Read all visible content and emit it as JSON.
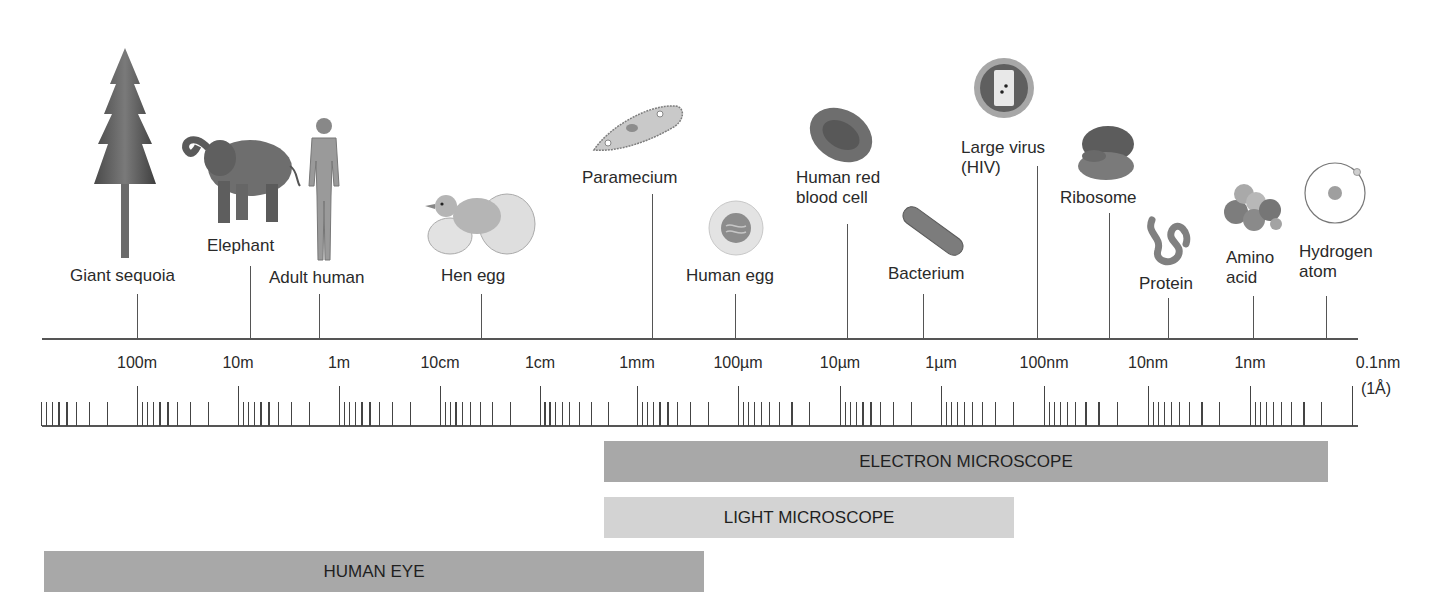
{
  "diagram": {
    "type": "log-scale size comparison",
    "objects": [
      {
        "id": "giant-sequoia",
        "label": "Giant sequoia",
        "size": "~100m"
      },
      {
        "id": "elephant",
        "label": "Elephant",
        "size": "~10m"
      },
      {
        "id": "adult-human",
        "label": "Adult human",
        "size": "~1.7m"
      },
      {
        "id": "hen-egg",
        "label": "Hen egg",
        "size": "~5cm"
      },
      {
        "id": "paramecium",
        "label": "Paramecium",
        "size": "~0.2mm"
      },
      {
        "id": "human-egg",
        "label": "Human egg",
        "size": "~100µm"
      },
      {
        "id": "red-blood-cell",
        "label_line1": "Human red",
        "label_line2": "blood cell",
        "size": "~7µm"
      },
      {
        "id": "bacterium",
        "label": "Bacterium",
        "size": "~1µm"
      },
      {
        "id": "large-virus",
        "label_line1": "Large virus",
        "label_line2": "(HIV)",
        "size": "~100nm"
      },
      {
        "id": "ribosome",
        "label": "Ribosome",
        "size": "~25nm"
      },
      {
        "id": "protein",
        "label": "Protein",
        "size": "~5nm"
      },
      {
        "id": "amino-acid",
        "label_line1": "Amino",
        "label_line2": "acid",
        "size": "~1nm"
      },
      {
        "id": "hydrogen-atom",
        "label_line1": "Hydrogen",
        "label_line2": "atom",
        "size": "~0.1nm"
      }
    ],
    "scale_labels": [
      "100m",
      "10m",
      "1m",
      "10cm",
      "1cm",
      "1mm",
      "100µm",
      "10µm",
      "1µm",
      "100nm",
      "10nm",
      "1nm",
      "0.1nm"
    ],
    "scale_note": "(1Å)",
    "ranges": [
      {
        "label": "ELECTRON MICROSCOPE",
        "from": "1mm",
        "to": "~0.2nm",
        "color": "#a9a9a9"
      },
      {
        "label": "LIGHT MICROSCOPE",
        "from": "1mm",
        "to": "~200nm",
        "color": "#d2d2d2"
      },
      {
        "label": "HUMAN EYE",
        "from": ">100m",
        "to": "~100µm",
        "color": "#a9a9a9"
      }
    ]
  }
}
